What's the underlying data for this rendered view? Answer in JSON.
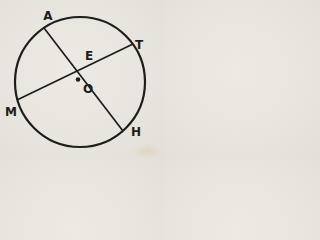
{
  "figure": {
    "type": "circle-with-two-intersecting-chords",
    "description_visible_elements": "circle, chord A-H, chord M-T, intersection point E, center dot labeled O",
    "ink_color": "#1d1d1b",
    "paper_color": "#e8e5df",
    "labels": {
      "top_left_point": "A",
      "top_right_point": "T",
      "left_point": "M",
      "bottom_right_point": "H",
      "intersection_point": "E",
      "center_point": "O"
    }
  }
}
